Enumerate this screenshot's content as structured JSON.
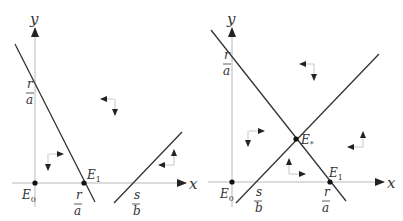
{
  "figure": {
    "panels": [
      {
        "id": "left",
        "description": "Nullclines do not intersect in first quadrant (s/b > r/a)",
        "axes": {
          "x_label": "x",
          "y_label": "y"
        },
        "equilibria": [
          {
            "name": "E0",
            "label_main": "E",
            "label_sub": "0"
          },
          {
            "name": "E1",
            "label_main": "E",
            "label_sub": "1"
          }
        ],
        "intercepts": {
          "y_axis": {
            "num": "r",
            "den": "a"
          },
          "x_axis_1": {
            "num": "r",
            "den": "a"
          },
          "x_axis_2": {
            "num": "s",
            "den": "b"
          }
        }
      },
      {
        "id": "right",
        "description": "Nullclines intersect at interior equilibrium E*",
        "axes": {
          "x_label": "x",
          "y_label": "y"
        },
        "equilibria": [
          {
            "name": "E0",
            "label_main": "E",
            "label_sub": "0"
          },
          {
            "name": "E*",
            "label_main": "E",
            "label_sub": "*"
          },
          {
            "name": "E1",
            "label_main": "E",
            "label_sub": "1"
          }
        ],
        "intercepts": {
          "y_axis": {
            "num": "r",
            "den": "a"
          },
          "x_axis_1": {
            "num": "s",
            "den": "b"
          },
          "x_axis_2": {
            "num": "r",
            "den": "a"
          }
        }
      }
    ]
  }
}
